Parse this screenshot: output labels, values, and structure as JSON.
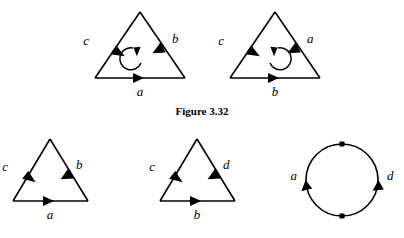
{
  "figure": {
    "caption": "Figure 3.32",
    "top_row": [
      {
        "name": "triangle-top-left",
        "edges": [
          {
            "label": "c",
            "side": "left",
            "direction": "down-left"
          },
          {
            "label": "b",
            "side": "right",
            "direction": "up-left"
          },
          {
            "label": "a",
            "side": "bottom",
            "direction": "right"
          }
        ],
        "interior_loop": {
          "present": true,
          "orientation": "counterclockwise"
        }
      },
      {
        "name": "triangle-top-right",
        "edges": [
          {
            "label": "c",
            "side": "left",
            "direction": "down-left"
          },
          {
            "label": "a",
            "side": "right",
            "direction": "up-left"
          },
          {
            "label": "b",
            "side": "bottom",
            "direction": "right"
          }
        ],
        "interior_loop": {
          "present": true,
          "orientation": "clockwise"
        }
      }
    ],
    "bottom_row": [
      {
        "name": "triangle-bottom-left",
        "edges": [
          {
            "label": "c",
            "side": "left",
            "direction": "down-left"
          },
          {
            "label": "b",
            "side": "right",
            "direction": "up-left"
          },
          {
            "label": "a",
            "side": "bottom",
            "direction": "right"
          }
        ],
        "interior_loop": {
          "present": false,
          "orientation": ""
        }
      },
      {
        "name": "triangle-bottom-middle",
        "edges": [
          {
            "label": "c",
            "side": "left",
            "direction": "down-left"
          },
          {
            "label": "d",
            "side": "right",
            "direction": "up-left"
          },
          {
            "label": "b",
            "side": "bottom",
            "direction": "right"
          }
        ],
        "interior_loop": {
          "present": false,
          "orientation": ""
        }
      },
      {
        "name": "circle-bottom-right",
        "shape": "circle",
        "vertices": [
          "top",
          "bottom"
        ],
        "arcs": [
          {
            "label": "a",
            "side": "left",
            "direction": "up"
          },
          {
            "label": "d",
            "side": "right",
            "direction": "up"
          }
        ]
      }
    ],
    "colors": {
      "ink": "#000000",
      "background": "#ffffff"
    }
  }
}
